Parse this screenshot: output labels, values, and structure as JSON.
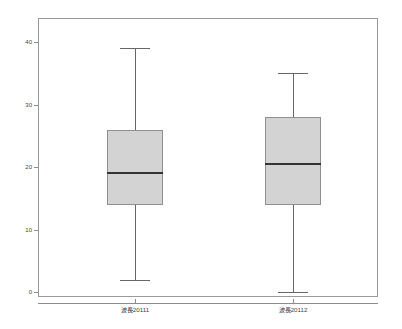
{
  "chart_data": {
    "type": "box",
    "title": "",
    "xlabel": "",
    "ylabel": "",
    "ylim": [
      -2,
      42
    ],
    "grid": false,
    "legend": null,
    "categories": [
      "波長20111",
      "波長20112"
    ],
    "ytick_labels": [
      "0",
      "10",
      "20",
      "30",
      "40"
    ],
    "ytick_values": [
      0,
      10,
      20,
      30,
      40
    ],
    "boxes": [
      {
        "label": "波長20111",
        "whisker_low": 2,
        "q1": 14,
        "median": 19,
        "q3": 26,
        "whisker_high": 39,
        "outliers": []
      },
      {
        "label": "波長20112",
        "whisker_low": 0,
        "q1": 14,
        "median": 20.5,
        "q3": 28,
        "whisker_high": 35,
        "outliers": []
      }
    ]
  },
  "style": {
    "box_fill": "#d3d3d3",
    "box_stroke": "#8f8f8f",
    "median_color": "#333333",
    "whisker_color": "#666666",
    "frame_color": "#9a9a9a",
    "tick_color": "#8c8c8c",
    "label_color": "#444444",
    "background": "#ffffff"
  },
  "axis": {
    "y_labels": [
      {
        "text": "40",
        "value": 40
      },
      {
        "text": "30",
        "value": 30
      },
      {
        "text": "20",
        "value": 20
      },
      {
        "text": "10",
        "value": 10
      },
      {
        "text": "0",
        "value": 0
      }
    ],
    "x_labels": [
      {
        "text": "波長20111"
      },
      {
        "text": "波長20112"
      }
    ]
  }
}
